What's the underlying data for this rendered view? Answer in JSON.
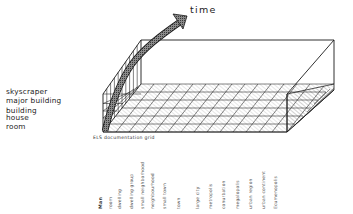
{
  "diagram": {
    "axis_time": {
      "label": "time"
    },
    "y_axis": {
      "description": "building scale levels (height of left wall)",
      "labels": [
        "skyscraper",
        "major building",
        "building",
        "house",
        "room"
      ]
    },
    "grid_caption": "ELS documentation grid",
    "x_axis": {
      "description": "settlement scale levels (along floor)",
      "labels": [
        "Man",
        "room",
        "dwelling",
        "dwelling group",
        "small neighborhood",
        "neighbourhood",
        "small town",
        "town",
        "large city",
        "metropolis",
        "conurbation",
        "megalopolis",
        "urban region",
        "urban continent",
        "Ecumenopolis"
      ]
    },
    "colors": {
      "ink": "#1a1a1a",
      "hatch": "#555555",
      "arrow_fill": "#6e6e6e",
      "background": "#ffffff"
    }
  }
}
